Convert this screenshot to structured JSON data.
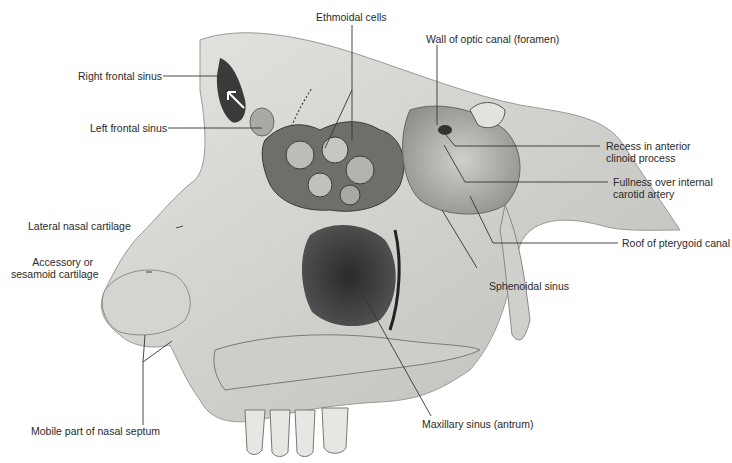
{
  "figure": {
    "colors": {
      "background": "#ffffff",
      "bone_light": "#d9d9d6",
      "bone_mid": "#b8b8b4",
      "cavity_dark": "#3c3c3c",
      "cavity_deep": "#1c1c1c",
      "leader_line": "#333333",
      "label_text": "#2a2a2a"
    }
  },
  "labels": {
    "ethmoidal_cells": "Ethmoidal cells",
    "wall_optic_canal": "Wall of optic canal (foramen)",
    "right_frontal_sinus": "Right frontal sinus",
    "left_frontal_sinus": "Left frontal sinus",
    "recess_anterior_clinoid": [
      "Recess in anterior",
      "clinoid process"
    ],
    "fullness_internal_carotid": [
      "Fullness over internal",
      "carotid artery"
    ],
    "lateral_nasal_cartilage": "Lateral nasal cartilage",
    "roof_pterygoid_canal": "Roof of pterygoid canal",
    "accessory_cartilage": [
      "Accessory or",
      "sesamoid cartilage"
    ],
    "sphenoidal_sinus": "Sphenoidal sinus",
    "maxillary_sinus": "Maxillary sinus (antrum)",
    "mobile_septum": "Mobile part of nasal septum"
  }
}
